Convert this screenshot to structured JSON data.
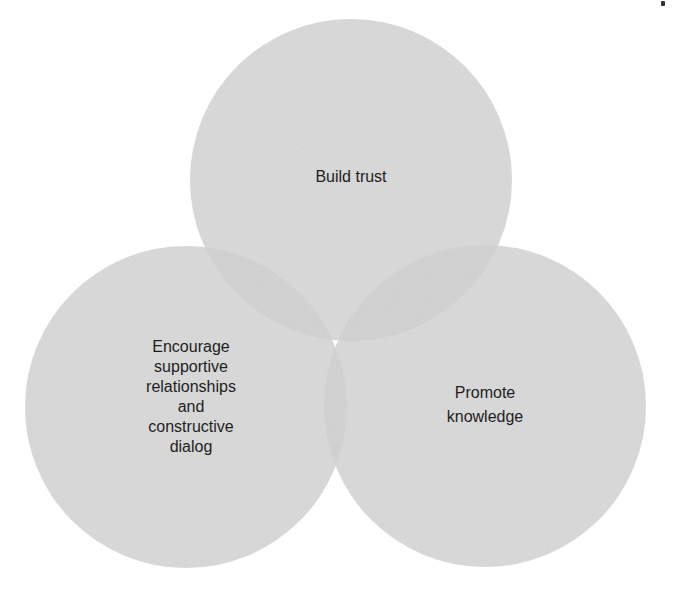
{
  "diagram": {
    "type": "venn",
    "colors": {
      "circle_fill": "#d6d6d6",
      "circle_opacity": 0.85,
      "text": "#1e1e1e",
      "background": "#ffffff"
    },
    "circles": [
      {
        "id": "top",
        "label": "Build trust",
        "cx": 351,
        "cy": 180,
        "r": 161
      },
      {
        "id": "left",
        "label": "Encourage\nsupportive\nrelationships\nand\nconstructive\ndialog",
        "cx": 186,
        "cy": 407,
        "r": 161
      },
      {
        "id": "right",
        "label": "Promote\nknowledge",
        "cx": 485,
        "cy": 406,
        "r": 161
      }
    ]
  }
}
